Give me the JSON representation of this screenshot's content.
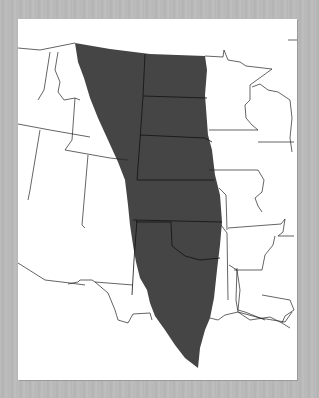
{
  "map": {
    "title": "Great Plains region of North America",
    "highlighted_region": "Great Plains",
    "region_color": "#454545",
    "background_color": "#b9b9b9",
    "land_color": "#ffffff",
    "border_color": "#222222",
    "states_shown": [
      "Washington",
      "Oregon",
      "Idaho",
      "Montana",
      "Wyoming",
      "Nevada",
      "Utah",
      "Colorado",
      "Arizona",
      "New Mexico",
      "North Dakota",
      "South Dakota",
      "Nebraska",
      "Kansas",
      "Oklahoma",
      "Texas",
      "Minnesota",
      "Iowa",
      "Missouri",
      "Arkansas",
      "Louisiana",
      "Wisconsin",
      "Illinois",
      "Michigan",
      "Mississippi"
    ],
    "states_in_region": [
      "Montana",
      "Wyoming",
      "Colorado",
      "New Mexico",
      "North Dakota",
      "South Dakota",
      "Nebraska",
      "Kansas",
      "Oklahoma",
      "Texas"
    ]
  }
}
